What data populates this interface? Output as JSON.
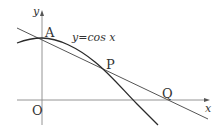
{
  "figure": {
    "curve_label": "y=cos x",
    "axis_labels": {
      "x": "x",
      "y": "y",
      "origin": "O"
    },
    "points": {
      "A": {
        "label": "A"
      },
      "P": {
        "label": "P"
      },
      "Q": {
        "label": "Q"
      }
    },
    "colors": {
      "curve": "#2a2a2a",
      "line": "#555555",
      "axes": "#777777",
      "text": "#333333"
    }
  }
}
